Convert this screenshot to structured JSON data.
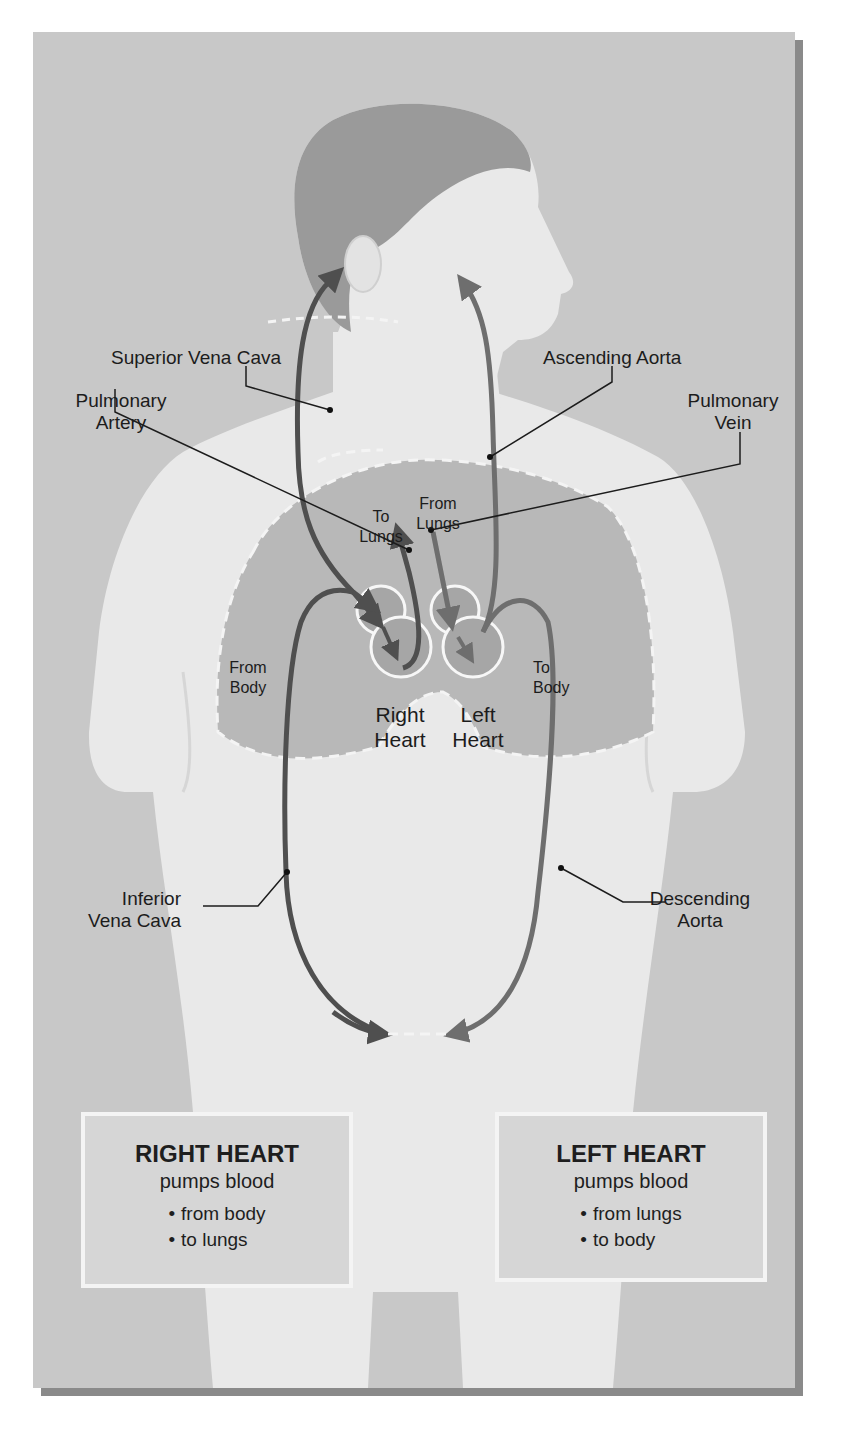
{
  "caption": {
    "text": "Figure ... Circulation through the heart and body",
    "visible_fragment": "Figure ... ngh ..y"
  },
  "colors": {
    "background_panel": "#c8c8c8",
    "torso_skin": "#e9e9e9",
    "hair": "#9a9a9a",
    "lungs": "#b8b8b8",
    "heart_chambers": "#a6a6a6",
    "vessel_vein": "#4f4f4f",
    "vessel_artery": "#6e6e6e",
    "panel_shadow": "#8a8a8a",
    "infobox_border": "#f4f4f4"
  },
  "labels": {
    "superior_vena_cava": "Superior Vena Cava",
    "ascending_aorta": "Ascending Aorta",
    "pulmonary_artery_line1": "Pulmonary",
    "pulmonary_artery_line2": "Artery",
    "pulmonary_vein_line1": "Pulmonary",
    "pulmonary_vein_line2": "Vein",
    "to_lungs_line1": "To",
    "to_lungs_line2": "Lungs",
    "from_lungs_line1": "From",
    "from_lungs_line2": "Lungs",
    "from_body_line1": "From",
    "from_body_line2": "Body",
    "to_body_line1": "To",
    "to_body_line2": "Body",
    "right_heart_line1": "Right",
    "right_heart_line2": "Heart",
    "left_heart_line1": "Left",
    "left_heart_line2": "Heart",
    "inferior_vena_cava_line1": "Inferior",
    "inferior_vena_cava_line2": "Vena Cava",
    "descending_aorta_line1": "Descending",
    "descending_aorta_line2": "Aorta"
  },
  "info_boxes": [
    {
      "title": "RIGHT HEART",
      "subtitle": "pumps blood",
      "bullets": [
        "from body",
        "to lungs"
      ]
    },
    {
      "title": "LEFT HEART",
      "subtitle": "pumps blood",
      "bullets": [
        "from lungs",
        "to body"
      ]
    }
  ]
}
